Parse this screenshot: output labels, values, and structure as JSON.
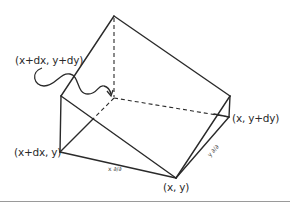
{
  "figure": {
    "type": "hand-drawn 3D wedge (triangular prism) diagram",
    "labels": {
      "top_back_corner": "(x+dx, y+dy)",
      "left_corner": "(x+dx, y)",
      "right_corner": "(x, y+dy)",
      "bottom_corner": "(x, y)",
      "edge_x_annotation": "x ∂/∂",
      "edge_y_annotation": "y ∂/∂"
    },
    "colors": {
      "line": "#2a2a2a",
      "background": "#ffffff",
      "rule": "#9a9a9a"
    }
  }
}
